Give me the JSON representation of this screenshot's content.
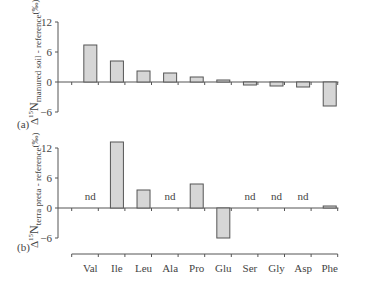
{
  "chart_data": [
    {
      "type": "bar",
      "panel": "(a)",
      "title": "",
      "xlabel": "",
      "ylabel": "Δ15N manured soil - reference (‰)",
      "ylim": [
        -6,
        12
      ],
      "yticks": [
        12,
        6,
        0,
        -6
      ],
      "grid": false,
      "categories": [
        "Val",
        "Ile",
        "Leu",
        "Ala",
        "Pro",
        "Glu",
        "Ser",
        "Gly",
        "Asp",
        "Phe"
      ],
      "values": [
        7.4,
        4.2,
        2.2,
        1.8,
        1.0,
        0.4,
        -0.6,
        -0.8,
        -1.0,
        -4.8
      ],
      "annotations": []
    },
    {
      "type": "bar",
      "panel": "(b)",
      "title": "",
      "xlabel": "",
      "ylabel": "Δ15N terra preta - reference (‰)",
      "ylim": [
        -6,
        12
      ],
      "yticks": [
        12,
        6,
        0,
        -6
      ],
      "grid": false,
      "categories": [
        "Val",
        "Ile",
        "Leu",
        "Ala",
        "Pro",
        "Glu",
        "Ser",
        "Gly",
        "Asp",
        "Phe"
      ],
      "values": [
        null,
        13.2,
        3.6,
        null,
        4.8,
        -6.0,
        null,
        null,
        null,
        0.4
      ],
      "annotations": [
        {
          "category": "Val",
          "text": "nd"
        },
        {
          "category": "Ala",
          "text": "nd"
        },
        {
          "category": "Ser",
          "text": "nd"
        },
        {
          "category": "Gly",
          "text": "nd"
        },
        {
          "category": "Asp",
          "text": "nd"
        }
      ]
    }
  ],
  "labels": {
    "panel_a": "(a)",
    "panel_b": "(b)",
    "ylabel_a_prefix": "Δ",
    "ylabel_a_sup": "15",
    "ylabel_a_main": "N",
    "ylabel_a_sub": "manured soil - reference",
    "ylabel_a_unit": "(‰)",
    "ylabel_b_prefix": "Δ",
    "ylabel_b_sup": "15",
    "ylabel_b_main": "N",
    "ylabel_b_sub": "terra preta - reference",
    "ylabel_b_unit": "(‰)",
    "nd": "nd"
  },
  "style": {
    "bar_fill": "#d6d6d6",
    "bar_stroke": "#555555",
    "axis_color": "#555555"
  }
}
